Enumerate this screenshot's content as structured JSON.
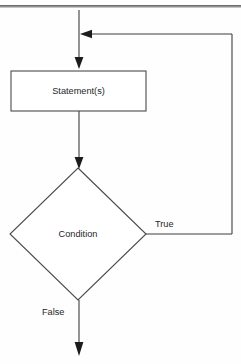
{
  "diagram": {
    "kind": "flowchart",
    "canvas": {
      "width": 241,
      "height": 364,
      "background": "#fefefe"
    },
    "colors": {
      "line": "#3d3d3d",
      "shape_stroke": "#4a4a4a",
      "shape_fill": "#ffffff",
      "text": "#262626",
      "rule": "#4b4b4b"
    },
    "nodes": [
      {
        "id": "statement",
        "type": "process",
        "label": "Statement(s)",
        "x": 11,
        "y": 71,
        "width": 135,
        "height": 40,
        "center_x": 78.5,
        "center_y": 91
      },
      {
        "id": "condition",
        "type": "decision",
        "label": "Condition",
        "center_x": 78,
        "center_y": 234,
        "half_width": 68,
        "half_height": 66
      }
    ],
    "edges": [
      {
        "id": "entry",
        "from": "top-of-page",
        "to": "statement",
        "label": "",
        "arrow": "down"
      },
      {
        "id": "statement-to-condition",
        "from": "statement",
        "to": "condition",
        "label": "",
        "arrow": "down"
      },
      {
        "id": "condition-true-loop",
        "from": "condition",
        "to": "entry",
        "label": "True",
        "arrow": "left"
      },
      {
        "id": "condition-false-exit",
        "from": "condition",
        "to": "exit",
        "label": "False",
        "arrow": "down"
      }
    ],
    "edge_labels": {
      "true": "True",
      "false": "False"
    }
  }
}
